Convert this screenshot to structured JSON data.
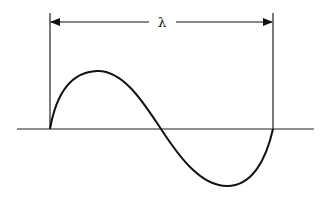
{
  "diagram": {
    "wavelength_label": "λ",
    "stroke_color": "#111111",
    "background": "#ffffff"
  }
}
